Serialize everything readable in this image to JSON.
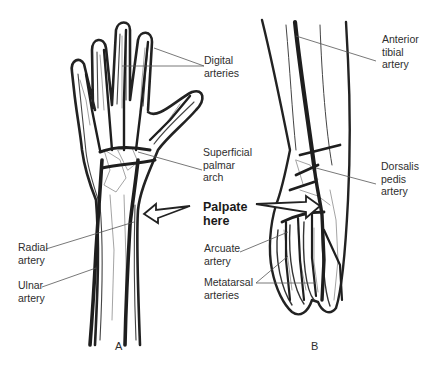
{
  "figure": {
    "panels": [
      {
        "id": "A",
        "label": "A",
        "subject": "hand-wrist"
      },
      {
        "id": "B",
        "label": "B",
        "subject": "foot-ankle"
      }
    ],
    "callout": {
      "text": "Palpate\nhere",
      "arrows": [
        "left-arrow-to-radial-artery",
        "right-arrow-to-dorsalis-pedis-artery"
      ]
    },
    "labels_A": {
      "digital_arteries": "Digital\narteries",
      "superficial_palmar_arch": "Superficial\npalmar\narch",
      "radial_artery": "Radial\nartery",
      "ulnar_artery": "Ulnar\nartery"
    },
    "labels_B": {
      "anterior_tibial_artery": "Anterior\ntibial\nartery",
      "dorsalis_pedis_artery": "Dorsalis\npedis\nartery",
      "arcuate_artery": "Arcuate\nartery",
      "metatarsal_arteries": "Metatarsal\narteries"
    },
    "colors": {
      "artery": "#1e1e1e",
      "outline": "#222222",
      "bone": "#9a9a9a",
      "leader": "#555555",
      "background": "#ffffff"
    }
  }
}
